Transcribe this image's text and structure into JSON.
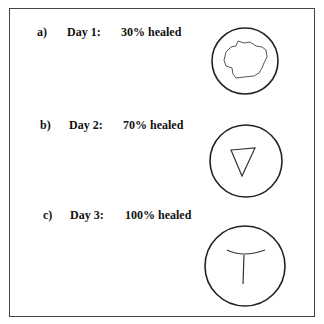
{
  "panels": [
    {
      "letter": "a)",
      "day": "Day 1:",
      "status": "30% healed",
      "shape": "irregular-wound"
    },
    {
      "letter": "b)",
      "day": "Day 2:",
      "status": "70% healed",
      "shape": "triangle-wound"
    },
    {
      "letter": "c)",
      "day": "Day 3:",
      "status": "100% healed",
      "shape": "t-shaped-scar"
    }
  ],
  "colors": {
    "stroke": "#222222",
    "wound": "#555555",
    "border": "#444444"
  }
}
